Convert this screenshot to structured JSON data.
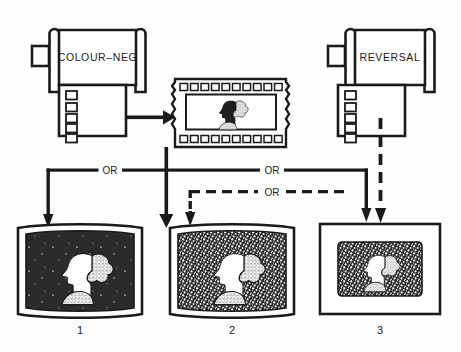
{
  "diagram": {
    "background_color": "#fefefe",
    "ink_color": "#1a1a1a",
    "sources": [
      {
        "id": "colour-neg",
        "label": "COLOUR–NEG",
        "type": "film-cassette",
        "sprocket_holes": 5
      },
      {
        "id": "reversal",
        "label": "REVERSAL",
        "type": "film-cassette",
        "sprocket_holes": 5
      }
    ],
    "intermediate": {
      "id": "negative-strip",
      "type": "film-strip-negative",
      "perforations_top": 11,
      "perforations_bottom": 11,
      "subject": "head-profile-silhouette"
    },
    "connectors": [
      {
        "id": "or-left",
        "label": "OR",
        "style": "solid"
      },
      {
        "id": "or-right",
        "label": "OR",
        "style": "solid"
      },
      {
        "id": "or-dashed",
        "label": "OR",
        "style": "dashed"
      }
    ],
    "outputs": [
      {
        "id": "print-1",
        "number": "1",
        "type": "colour-print",
        "frame": "curved-white-border",
        "render": "positive-dark-background"
      },
      {
        "id": "print-2",
        "number": "2",
        "type": "colour-print",
        "frame": "curved-white-border",
        "render": "grainy-positive"
      },
      {
        "id": "slide-3",
        "number": "3",
        "type": "mounted-slide",
        "frame": "square-mount",
        "render": "grainy-transparency"
      }
    ]
  }
}
